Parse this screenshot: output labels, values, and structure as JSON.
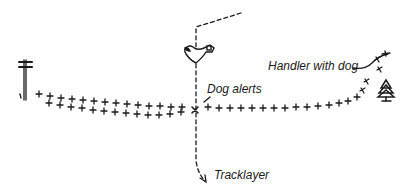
{
  "diagram": {
    "type": "tracking-scenario-sketch",
    "labels": {
      "handler": "Handler with dog",
      "alert": "Dog alerts",
      "tracklayer": "Tracklayer"
    },
    "elements": [
      {
        "name": "telephone-pole",
        "position": "left end of track"
      },
      {
        "name": "dog-track-footprints",
        "description": "double row of cross marks from pole to alert point"
      },
      {
        "name": "alert-marker",
        "symbol": "x",
        "description": "point where dog alerts"
      },
      {
        "name": "bird-icon",
        "description": "bird above alert point"
      },
      {
        "name": "tracklayer-path",
        "style": "dashed",
        "description": "dashed line crossing the track vertically, from top right to bottom with arrow"
      },
      {
        "name": "handler-track",
        "description": "single row of cross marks curving from alert point up to handler"
      },
      {
        "name": "tree-icon",
        "position": "right side near handler"
      }
    ],
    "colors": {
      "ink": "#1a1a1a",
      "background": "#ffffff"
    }
  }
}
